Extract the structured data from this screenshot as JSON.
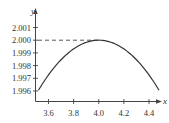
{
  "chart_data": {
    "type": "line",
    "title": "",
    "xlabel": "x",
    "ylabel": "y",
    "xlim": [
      3.5,
      4.5
    ],
    "ylim": [
      1.9955,
      2.0015
    ],
    "x_ticks": [
      "3.6",
      "3.8",
      "4.0",
      "4.2",
      "4.4"
    ],
    "y_ticks": [
      "1.996",
      "1.997",
      "1.998",
      "1.999",
      "2.000",
      "2.001"
    ],
    "grid": false,
    "legend": null,
    "annotations": [
      {
        "type": "dashed-horizontal-line",
        "y": 2.0,
        "from_x": "y-axis",
        "to_x": 4.0
      }
    ],
    "series": [
      {
        "name": "curve",
        "description": "concave-down parabola with maximum at (4.0, 2.000)",
        "x": [
          3.52,
          3.6,
          3.7,
          3.8,
          3.9,
          4.0,
          4.1,
          4.2,
          4.3,
          4.4,
          4.48
        ],
        "y": [
          1.99606,
          1.9967,
          1.9978,
          1.9991,
          1.9998,
          2.0,
          1.9998,
          1.9991,
          1.9978,
          1.9967,
          1.99606
        ]
      }
    ]
  }
}
